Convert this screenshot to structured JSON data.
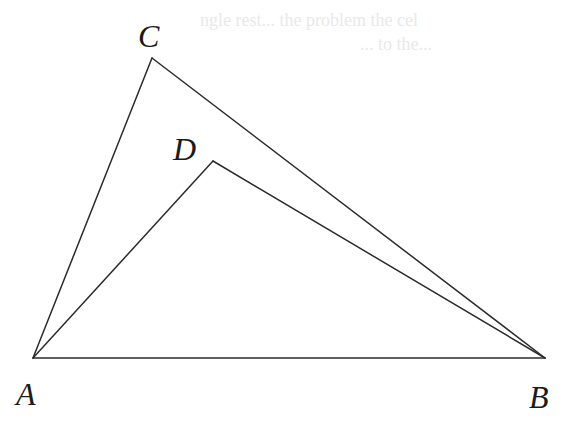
{
  "figure": {
    "width": 564,
    "height": 421,
    "background": "#ffffff",
    "stroke_color": "#2b2b2b",
    "label_color": "#1a1a1a"
  },
  "points": {
    "A": {
      "x": 33,
      "y": 358,
      "label": "A",
      "label_x": 16,
      "label_y": 405
    },
    "B": {
      "x": 545,
      "y": 358,
      "label": "B",
      "label_x": 529,
      "label_y": 408
    },
    "C": {
      "x": 152,
      "y": 58,
      "label": "C",
      "label_x": 138,
      "label_y": 47
    },
    "D": {
      "x": 213,
      "y": 161,
      "label": "D",
      "label_x": 173,
      "label_y": 160
    }
  },
  "segments": [
    {
      "from": "A",
      "to": "B"
    },
    {
      "from": "A",
      "to": "C"
    },
    {
      "from": "C",
      "to": "B"
    },
    {
      "from": "A",
      "to": "D"
    },
    {
      "from": "D",
      "to": "B"
    }
  ],
  "ghost_text": {
    "line1": "ngle rest... the problem the cel",
    "line2": "... to the..."
  }
}
